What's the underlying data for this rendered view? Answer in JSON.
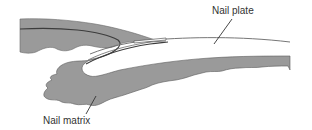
{
  "diagram": {
    "labels": {
      "nail_plate": "Nail plate",
      "nail_matrix": "Nail matrix"
    },
    "colors": {
      "tissue_fill": "#9a9a9a",
      "outline": "#4a4a4a",
      "leader_line": "#333333",
      "label_text": "#333333",
      "background": "#ffffff"
    }
  }
}
